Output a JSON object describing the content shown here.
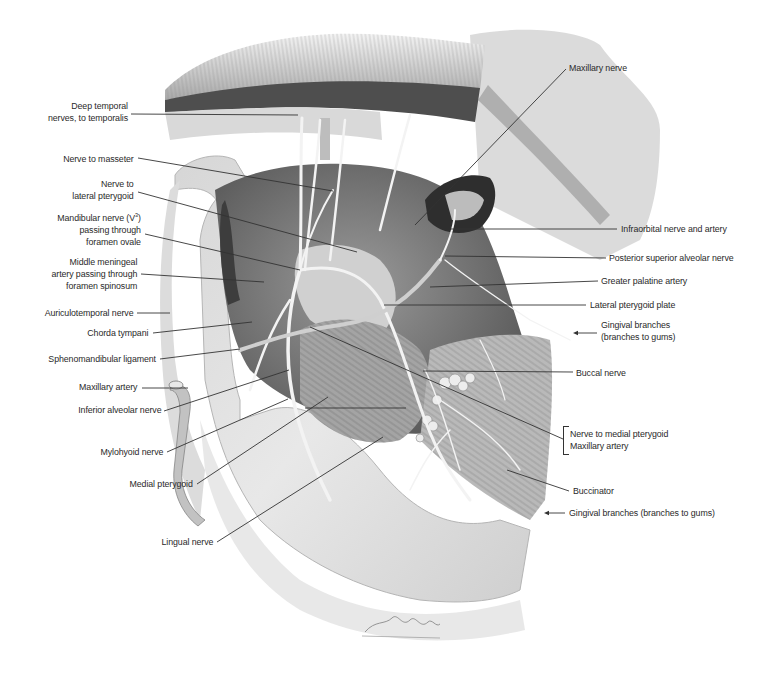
{
  "figure": {
    "type": "anatomical-illustration",
    "signature": "D. Török",
    "colors": {
      "background": "#ffffff",
      "label_text": "#2a2a2a",
      "leader_line": "#333333",
      "bone_light": "#e4e4e4",
      "bone_mid": "#c8c8c8",
      "muscle_dark": "#6e6e6e",
      "shadow": "#3a3a3a"
    }
  },
  "labels": {
    "left": [
      {
        "id": "deep-temporal",
        "lines": [
          "Deep temporal",
          "nerves, to temporalis"
        ],
        "x": 128,
        "y": 100
      },
      {
        "id": "nerve-to-masseter",
        "lines": [
          "Nerve to masseter"
        ],
        "x": 134,
        "y": 153
      },
      {
        "id": "nerve-to-lateral-pterygoid",
        "lines": [
          "Nerve to",
          "lateral pterygoid"
        ],
        "x": 134,
        "y": 178
      },
      {
        "id": "mandibular-nerve",
        "lines": [
          "Mandibular nerve (V³)",
          "passing through",
          "foramen ovale"
        ],
        "x": 141,
        "y": 212
      },
      {
        "id": "middle-meningeal",
        "lines": [
          "Middle meningeal",
          "artery passing through",
          "foramen spinosum"
        ],
        "x": 137,
        "y": 256
      },
      {
        "id": "auriculotemporal",
        "lines": [
          "Auriculotemporal nerve"
        ],
        "x": 133,
        "y": 307
      },
      {
        "id": "chorda-tympani",
        "lines": [
          "Chorda tympani"
        ],
        "x": 148,
        "y": 327
      },
      {
        "id": "sphenomandibular",
        "lines": [
          "Sphenomandibular ligament"
        ],
        "x": 156,
        "y": 353
      },
      {
        "id": "maxillary-artery-left",
        "lines": [
          "Maxillary artery"
        ],
        "x": 137,
        "y": 381
      },
      {
        "id": "inferior-alveolar",
        "lines": [
          "Inferior alveolar nerve"
        ],
        "x": 161,
        "y": 404
      },
      {
        "id": "mylohyoid",
        "lines": [
          "Mylohyoid nerve"
        ],
        "x": 163,
        "y": 446
      },
      {
        "id": "medial-pterygoid",
        "lines": [
          "Medial pterygoid"
        ],
        "x": 193,
        "y": 478
      },
      {
        "id": "lingual-nerve",
        "lines": [
          "Lingual nerve"
        ],
        "x": 213,
        "y": 536
      }
    ],
    "right": [
      {
        "id": "maxillary-nerve",
        "lines": [
          "Maxillary nerve"
        ],
        "x": 569,
        "y": 62
      },
      {
        "id": "infraorbital",
        "lines": [
          "Infraorbital nerve and artery"
        ],
        "x": 621,
        "y": 223
      },
      {
        "id": "posterior-superior-alveolar",
        "lines": [
          "Posterior superior alveolar nerve"
        ],
        "x": 609,
        "y": 252
      },
      {
        "id": "greater-palatine",
        "lines": [
          "Greater palatine artery"
        ],
        "x": 601,
        "y": 275
      },
      {
        "id": "lateral-pterygoid-plate",
        "lines": [
          "Lateral pterygoid plate"
        ],
        "x": 590,
        "y": 299
      },
      {
        "id": "gingival-upper",
        "lines": [
          "Gingival branches",
          "(branches to gums)"
        ],
        "x": 601,
        "y": 319
      },
      {
        "id": "buccal-nerve",
        "lines": [
          "Buccal nerve"
        ],
        "x": 576,
        "y": 367
      },
      {
        "id": "nerve-to-medial-pterygoid",
        "lines": [
          "Nerve to medial pterygoid",
          "Maxillary artery"
        ],
        "x": 570,
        "y": 428
      },
      {
        "id": "buccinator",
        "lines": [
          "Buccinator"
        ],
        "x": 573,
        "y": 485
      },
      {
        "id": "gingival-lower",
        "lines": [
          "Gingival branches (branches to gums)"
        ],
        "x": 569,
        "y": 507
      }
    ]
  },
  "leaders": [
    {
      "for": "deep-temporal",
      "x1": 131,
      "y1": 114,
      "x2": 298,
      "y2": 115
    },
    {
      "for": "nerve-to-masseter",
      "x1": 138,
      "y1": 158,
      "x2": 333,
      "y2": 191
    },
    {
      "for": "nerve-to-lateral-pterygoid",
      "x1": 138,
      "y1": 192,
      "x2": 357,
      "y2": 252
    },
    {
      "for": "mandibular-nerve",
      "x1": 145,
      "y1": 234,
      "x2": 300,
      "y2": 270
    },
    {
      "for": "middle-meningeal",
      "x1": 141,
      "y1": 274,
      "x2": 264,
      "y2": 282
    },
    {
      "for": "auriculotemporal",
      "x1": 137,
      "y1": 313,
      "x2": 170,
      "y2": 313
    },
    {
      "for": "chorda-tympani",
      "x1": 153,
      "y1": 333,
      "x2": 252,
      "y2": 322
    },
    {
      "for": "sphenomandibular",
      "x1": 160,
      "y1": 359,
      "x2": 240,
      "y2": 349
    },
    {
      "for": "maxillary-artery-left",
      "x1": 142,
      "y1": 388,
      "x2": 188,
      "y2": 388
    },
    {
      "for": "inferior-alveolar",
      "x1": 164,
      "y1": 411,
      "x2": 289,
      "y2": 370
    },
    {
      "for": "mylohyoid",
      "x1": 167,
      "y1": 452,
      "x2": 288,
      "y2": 399
    },
    {
      "for": "medial-pterygoid",
      "x1": 197,
      "y1": 484,
      "x2": 328,
      "y2": 397
    },
    {
      "for": "lingual-nerve",
      "x1": 217,
      "y1": 542,
      "x2": 383,
      "y2": 437
    },
    {
      "for": "maxillary-nerve",
      "x1": 566,
      "y1": 69,
      "x2": 415,
      "y2": 225
    },
    {
      "for": "infraorbital",
      "x1": 617,
      "y1": 229,
      "x2": 451,
      "y2": 229
    },
    {
      "for": "posterior-superior-alveolar",
      "x1": 606,
      "y1": 258,
      "x2": 445,
      "y2": 256
    },
    {
      "for": "greater-palatine",
      "x1": 598,
      "y1": 281,
      "x2": 430,
      "y2": 287
    },
    {
      "for": "lateral-pterygoid-plate",
      "x1": 586,
      "y1": 305,
      "x2": 384,
      "y2": 305
    },
    {
      "for": "buccal-nerve",
      "x1": 573,
      "y1": 372,
      "x2": 423,
      "y2": 371
    },
    {
      "for": "nerve-to-medial-pterygoid",
      "x1": 563,
      "y1": 439,
      "x2": 310,
      "y2": 327
    },
    {
      "for": "buccinator",
      "x1": 569,
      "y1": 491,
      "x2": 507,
      "y2": 470
    },
    {
      "for": "inner-lower-medial",
      "x1": 406,
      "y1": 408,
      "x2": 305,
      "y2": 408
    }
  ],
  "arrows": [
    {
      "for": "gingival-upper",
      "x1": 597,
      "y1": 333,
      "x2": 573,
      "y2": 333
    },
    {
      "for": "gingival-lower",
      "x1": 565,
      "y1": 513,
      "x2": 544,
      "y2": 513
    }
  ],
  "bracket": {
    "for": "nerve-to-medial-pterygoid",
    "x": 563,
    "y": 426,
    "height": 27
  }
}
